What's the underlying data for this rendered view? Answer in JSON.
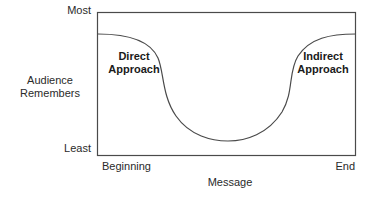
{
  "diagram": {
    "y_axis": {
      "title": "Audience Remembers",
      "title_lines": [
        "Audience",
        "Remembers"
      ],
      "max_label": "Most",
      "min_label": "Least"
    },
    "x_axis": {
      "title": "Message",
      "min_label": "Beginning",
      "max_label": "End"
    },
    "regions": {
      "left": {
        "lines": [
          "Direct",
          "Approach"
        ]
      },
      "right": {
        "lines": [
          "Indirect",
          "Approach"
        ]
      }
    },
    "colors": {
      "line": "#4a4a4a",
      "text": "#2a2a2a",
      "background": "#ffffff"
    }
  }
}
